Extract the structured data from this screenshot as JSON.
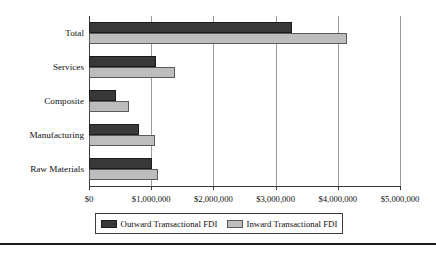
{
  "chart_data": {
    "type": "bar",
    "orientation": "horizontal",
    "title": "",
    "xlabel": "",
    "ylabel": "",
    "categories": [
      "Total",
      "Services",
      "Composite",
      "Manufacturing",
      "Raw Materials"
    ],
    "series": [
      {
        "name": "Outward Transactional FDI",
        "color": "#383838",
        "values": [
          3260000,
          1080000,
          430000,
          800000,
          1010000
        ]
      },
      {
        "name": "Inward Transactional FDI",
        "color": "#bdbdbd",
        "values": [
          4140000,
          1380000,
          640000,
          1060000,
          1110000
        ]
      }
    ],
    "xlim": [
      0,
      5000000
    ],
    "xticks": [
      0,
      1000000,
      2000000,
      3000000,
      4000000,
      5000000
    ],
    "xtick_labels": [
      "$0",
      "$1,000,000",
      "$2,000,000",
      "$3,000,000",
      "$4,000,000",
      "$5,000,000"
    ],
    "grid": "vertical",
    "legend_position": "bottom"
  },
  "legend": {
    "items": [
      {
        "label": "Outward Transactional FDI",
        "swatch": "dark-swatch-icon"
      },
      {
        "label": "Inward Transactional FDI",
        "swatch": "light-swatch-icon"
      }
    ]
  }
}
